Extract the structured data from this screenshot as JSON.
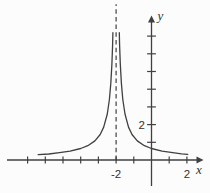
{
  "figure": {
    "kind": "math-function-graph",
    "stroke_color": "#404040",
    "background_color": "#fcfcfc"
  },
  "chart_data": {
    "type": "line",
    "title": "",
    "xlabel": "x",
    "ylabel": "y",
    "xlim": [
      -8.2,
      2.9
    ],
    "ylim": [
      -1.9,
      8.2
    ],
    "grid": false,
    "legend": false,
    "x_ticks": [
      -7,
      -6,
      -5,
      -4,
      -3,
      -2,
      -1,
      1,
      2
    ],
    "y_ticks": [
      1,
      2,
      3,
      4,
      5,
      6,
      7
    ],
    "x_tick_labels": [
      {
        "value": -2,
        "label": "-2"
      },
      {
        "value": 2,
        "label": "2"
      }
    ],
    "y_tick_labels": [
      {
        "value": 2,
        "label": "2"
      }
    ],
    "asymptote": {
      "x": -2,
      "style": "dashed",
      "y_top": 8.8
    },
    "series": [
      {
        "name": "curve",
        "branches": [
          [
            [
              -6.4,
              0.3
            ],
            [
              -5.8,
              0.34
            ],
            [
              -5.2,
              0.41
            ],
            [
              -4.6,
              0.5
            ],
            [
              -4.0,
              0.65
            ],
            [
              -3.6,
              0.81
            ],
            [
              -3.2,
              1.08
            ],
            [
              -2.9,
              1.44
            ],
            [
              -2.7,
              1.86
            ],
            [
              -2.5,
              2.6
            ],
            [
              -2.38,
              3.42
            ],
            [
              -2.3,
              4.33
            ],
            [
              -2.24,
              5.42
            ],
            [
              -2.2,
              6.5
            ],
            [
              -2.18,
              7.2
            ]
          ],
          [
            [
              -1.82,
              7.2
            ],
            [
              -1.8,
              6.5
            ],
            [
              -1.76,
              5.42
            ],
            [
              -1.7,
              4.33
            ],
            [
              -1.62,
              3.42
            ],
            [
              -1.5,
              2.6
            ],
            [
              -1.3,
              1.86
            ],
            [
              -1.1,
              1.44
            ],
            [
              -0.8,
              1.08
            ],
            [
              -0.4,
              0.81
            ],
            [
              0.0,
              0.65
            ],
            [
              0.6,
              0.5
            ],
            [
              1.2,
              0.41
            ],
            [
              1.7,
              0.35
            ],
            [
              2.05,
              0.32
            ]
          ]
        ]
      }
    ]
  }
}
